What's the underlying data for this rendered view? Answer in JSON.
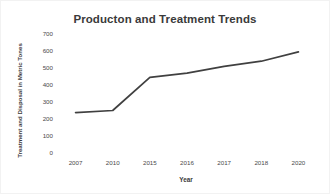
{
  "chart_data": {
    "type": "line",
    "title": "Producton and Treatment Trends",
    "xlabel": "Year",
    "ylabel": "Treatment and Disposal in Metric Tones",
    "categories": [
      "2007",
      "2010",
      "2015",
      "2016",
      "2017",
      "2018",
      "2020"
    ],
    "values": [
      238,
      250,
      445,
      470,
      510,
      540,
      595
    ],
    "series": [
      {
        "name": "Treatment and Disposal",
        "values": [
          238,
          250,
          445,
          470,
          510,
          540,
          595
        ],
        "color": "#404040"
      }
    ],
    "ylim": [
      0,
      700
    ],
    "ytick_labels": [
      "700",
      "600",
      "500",
      "400",
      "300",
      "200",
      "100",
      "0"
    ],
    "ytick_values": [
      700,
      600,
      500,
      400,
      300,
      200,
      100,
      0
    ],
    "grid": false,
    "legend": false,
    "legend_position": "none",
    "line_color": "#404040",
    "background_color": "#ffffff",
    "markers": false
  }
}
